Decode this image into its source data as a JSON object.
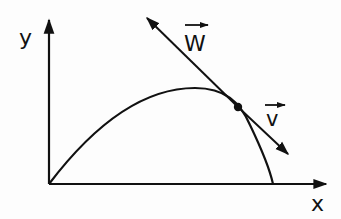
{
  "diagram": {
    "type": "projectile-trajectory",
    "axes": {
      "x_label": "x",
      "y_label": "y"
    },
    "vectors": {
      "w_label": "W",
      "v_label": "v"
    },
    "colors": {
      "ink": "#111111",
      "background": "#fdfdfd"
    }
  }
}
